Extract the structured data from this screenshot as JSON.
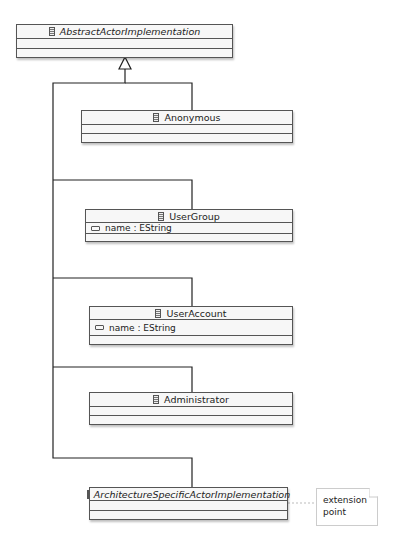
{
  "diagram": {
    "classes": [
      {
        "id": "abstract",
        "name": "AbstractActorImplementation",
        "italic": true,
        "attributes": []
      },
      {
        "id": "anonymous",
        "name": "Anonymous",
        "italic": false,
        "attributes": []
      },
      {
        "id": "usergroup",
        "name": "UserGroup",
        "italic": false,
        "attributes": [
          "name : EString"
        ]
      },
      {
        "id": "useraccount",
        "name": "UserAccount",
        "italic": false,
        "attributes": [
          "name : EString"
        ]
      },
      {
        "id": "administrator",
        "name": "Administrator",
        "italic": false,
        "attributes": []
      },
      {
        "id": "archspecific",
        "name": "ArchitectureSpecificActorImplementation",
        "italic": true,
        "attributes": []
      }
    ],
    "note": {
      "line1": "extension",
      "line2": "point"
    },
    "relations": [
      {
        "type": "generalization",
        "from": "anonymous",
        "to": "abstract"
      },
      {
        "type": "generalization",
        "from": "usergroup",
        "to": "abstract"
      },
      {
        "type": "generalization",
        "from": "useraccount",
        "to": "abstract"
      },
      {
        "type": "generalization",
        "from": "administrator",
        "to": "abstract"
      },
      {
        "type": "generalization",
        "from": "archspecific",
        "to": "abstract"
      },
      {
        "type": "note-link",
        "from": "archspecific",
        "to": "note"
      }
    ]
  }
}
